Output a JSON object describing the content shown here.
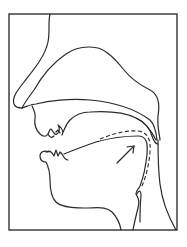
{
  "diagram": {
    "type": "sagittal-vocal-tract",
    "frame": {
      "x": 9,
      "y": 14,
      "width": 168,
      "height": 216
    },
    "colors": {
      "line": "#2a2a2a",
      "frame": "#333333",
      "background": "#ffffff"
    },
    "parts": [
      {
        "name": "nose",
        "style": "solid"
      },
      {
        "name": "nasal-cavity",
        "style": "solid"
      },
      {
        "name": "hard-palate",
        "style": "solid"
      },
      {
        "name": "velum",
        "style": "solid"
      },
      {
        "name": "upper-lip-and-teeth",
        "style": "solid"
      },
      {
        "name": "lower-lip-and-teeth",
        "style": "solid"
      },
      {
        "name": "tongue",
        "style": "solid"
      },
      {
        "name": "tongue-alternate-position",
        "style": "dashed"
      },
      {
        "name": "movement-arrow",
        "style": "solid",
        "direction": "up-right toward velum"
      },
      {
        "name": "chin-and-throat",
        "style": "solid"
      },
      {
        "name": "pharynx-back-wall",
        "style": "solid"
      },
      {
        "name": "epiglottis",
        "style": "solid"
      }
    ],
    "labels": []
  }
}
